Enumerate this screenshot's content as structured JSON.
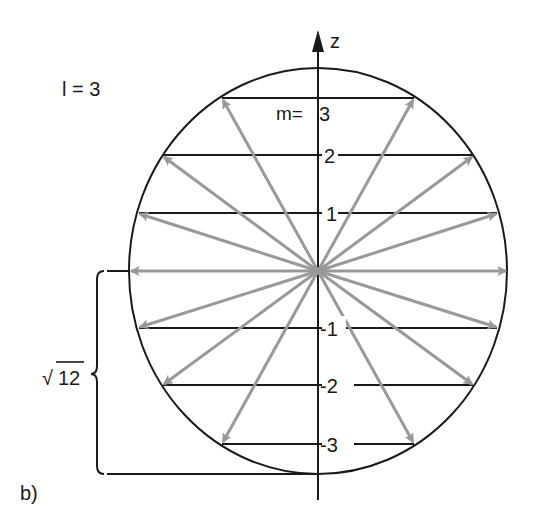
{
  "figure": {
    "panel_label": "b)",
    "quantum_number_label": "l = 3",
    "axis_label": "z",
    "m_prefix": "m=",
    "magnitude_label_radical": "√",
    "magnitude_label_value": "12",
    "m_values": [
      "3",
      "2",
      "1",
      "-1",
      "-2",
      "-3"
    ],
    "m_labels": {
      "m3": "3",
      "m2": "2",
      "m1": "1",
      "mneg1": "-1",
      "mneg2": "-2",
      "mneg3": "-3"
    },
    "colors": {
      "lines": "#1a1a1a",
      "vectors": "#999999",
      "background": "#ffffff"
    }
  }
}
